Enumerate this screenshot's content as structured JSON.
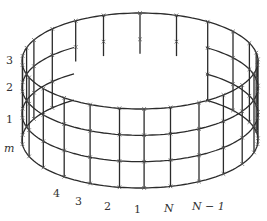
{
  "figure": {
    "ring_labels": [
      {
        "text": "3",
        "italic": false
      },
      {
        "text": "2",
        "italic": false
      },
      {
        "text": "1",
        "italic": false
      },
      {
        "text": "m",
        "italic": true
      }
    ],
    "column_labels": [
      {
        "text": "4",
        "italic": false
      },
      {
        "text": "3",
        "italic": false
      },
      {
        "text": "2",
        "italic": false
      },
      {
        "text": "1",
        "italic": false
      },
      {
        "text": "N",
        "italic": true
      },
      {
        "text": "N − 1",
        "italic": true
      }
    ],
    "geometry": {
      "cx": 140,
      "rx": 118,
      "ry": 48,
      "ring_centers_y": [
        61,
        87.3,
        113.7,
        140
      ],
      "column_angles_deg": [
        100,
        115,
        130,
        145,
        160,
        175,
        186,
        196,
        206,
        222,
        237,
        252,
        270,
        288,
        305,
        322,
        338,
        350,
        358,
        5,
        15,
        30,
        45,
        60,
        75,
        88
      ],
      "front_column_labels_angles_deg": [
        122,
        106,
        90,
        78,
        64,
        50
      ]
    },
    "colors": {
      "line": "#2b2b2b",
      "node": "#555555",
      "label": "#333333"
    }
  }
}
